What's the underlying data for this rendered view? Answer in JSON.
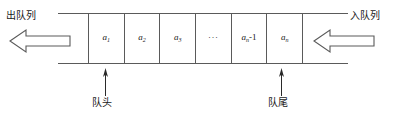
{
  "diagram": {
    "type": "queue-structure-diagram",
    "stroke_color": "#5a5a5a",
    "text_color": "#1a1a1a",
    "background_color": "#ffffff",
    "labels": {
      "dequeue": "出队列",
      "enqueue": "入队列",
      "head": "队头",
      "tail": "队尾"
    },
    "cells": [
      {
        "base": "a",
        "sub": "1",
        "suffix": "",
        "dots": false
      },
      {
        "base": "a",
        "sub": "2",
        "suffix": "",
        "dots": false
      },
      {
        "base": "a",
        "sub": "3",
        "suffix": "",
        "dots": false
      },
      {
        "base": "",
        "sub": "",
        "suffix": "",
        "dots": true,
        "text": "···"
      },
      {
        "base": "a",
        "sub": "n",
        "suffix": "-1",
        "dots": false
      },
      {
        "base": "a",
        "sub": "n",
        "suffix": "",
        "dots": false
      }
    ],
    "arrows": {
      "dequeue_direction": "left",
      "enqueue_direction": "left",
      "head_pointer_direction": "up",
      "tail_pointer_direction": "up"
    }
  }
}
